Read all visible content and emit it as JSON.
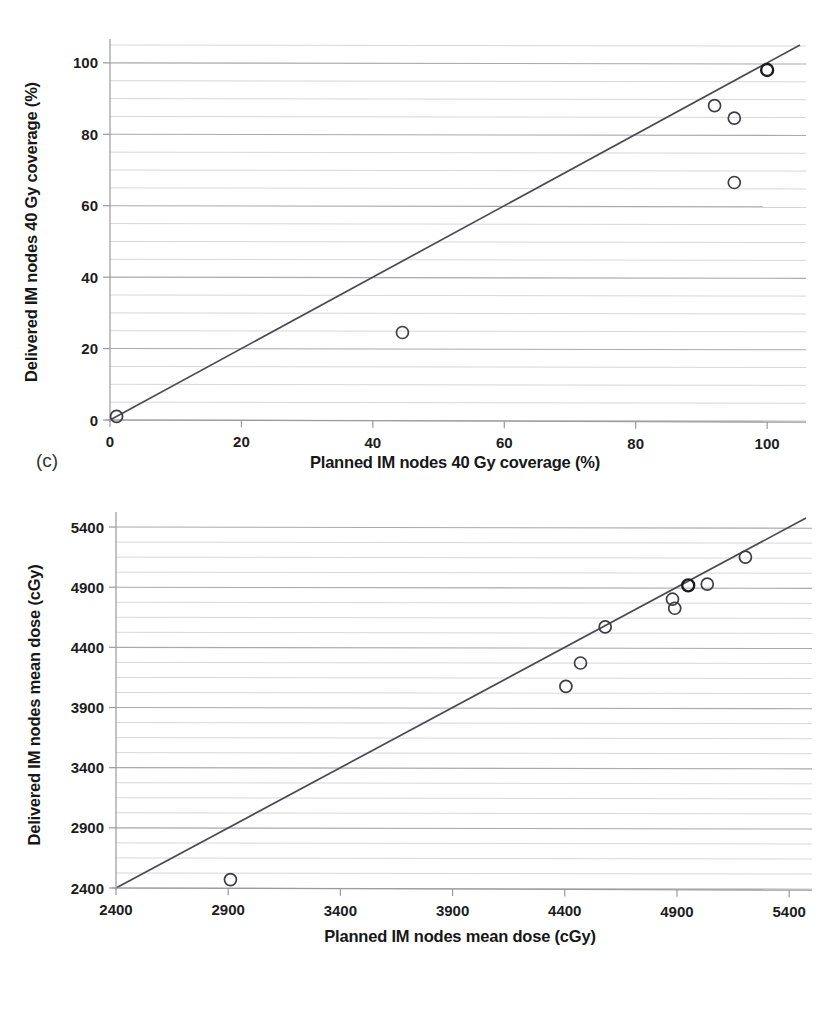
{
  "figure": {
    "panels": [
      {
        "letter": "(c)",
        "chart_index": 0
      },
      {
        "letter": "(d)",
        "chart_index": 1
      }
    ]
  },
  "chart_data": [
    {
      "type": "scatter",
      "title": "",
      "xlabel": "Planned IM nodes 40 Gy coverage (%)",
      "ylabel": "Delivered IM nodes 40 Gy coverage (%)",
      "xlim": [
        0,
        105
      ],
      "ylim": [
        0,
        105
      ],
      "xticks": [
        0,
        20,
        40,
        60,
        80,
        100
      ],
      "xtick_labels": [
        "0",
        "20",
        "40",
        "60",
        "80",
        "100"
      ],
      "yticks": [
        0,
        20,
        40,
        60,
        80,
        100
      ],
      "ytick_labels": [
        "0",
        "20",
        "40",
        "60",
        "80",
        "100"
      ],
      "grid": true,
      "grid_minor_step": 5,
      "legend": "none",
      "annotations": [
        "(c)"
      ],
      "reference_line": {
        "name": "identity-line",
        "description": "y = x line of identity",
        "from": [
          0,
          0
        ],
        "to": [
          105,
          105
        ]
      },
      "points": [
        {
          "x": 1.0,
          "y": 1.0,
          "emphasis": "normal"
        },
        {
          "x": 44.5,
          "y": 24.5,
          "emphasis": "normal"
        },
        {
          "x": 92.0,
          "y": 88.0,
          "emphasis": "normal"
        },
        {
          "x": 95.0,
          "y": 84.5,
          "emphasis": "normal"
        },
        {
          "x": 95.0,
          "y": 66.5,
          "emphasis": "normal"
        },
        {
          "x": 100.0,
          "y": 98.0,
          "emphasis": "dark"
        }
      ]
    },
    {
      "type": "scatter",
      "title": "",
      "xlabel": "Planned IM nodes mean dose (cGy)",
      "ylabel": "Delivered IM nodes mean dose (cGy)",
      "xlim": [
        2400,
        5475
      ],
      "ylim": [
        2400,
        5475
      ],
      "xticks": [
        2400,
        2900,
        3400,
        3900,
        4400,
        4900,
        5400
      ],
      "xtick_labels": [
        "2400",
        "2900",
        "3400",
        "3900",
        "4400",
        "4900",
        "5400"
      ],
      "yticks": [
        2400,
        2900,
        3400,
        3900,
        4400,
        4900,
        5400
      ],
      "ytick_labels": [
        "2400",
        "2900",
        "3400",
        "3900",
        "4400",
        "4900",
        "5400"
      ],
      "grid": true,
      "grid_minor_step": 125,
      "legend": "none",
      "annotations": [
        "(d)"
      ],
      "reference_line": {
        "name": "identity-line",
        "description": "y = x line of identity",
        "from": [
          2400,
          2400
        ],
        "to": [
          5475,
          5475
        ]
      },
      "points": [
        {
          "x": 2910,
          "y": 2470,
          "emphasis": "normal"
        },
        {
          "x": 4405,
          "y": 4075,
          "emphasis": "normal"
        },
        {
          "x": 4470,
          "y": 4270,
          "emphasis": "normal"
        },
        {
          "x": 4580,
          "y": 4570,
          "emphasis": "normal"
        },
        {
          "x": 4880,
          "y": 4800,
          "emphasis": "normal"
        },
        {
          "x": 4890,
          "y": 4725,
          "emphasis": "normal"
        },
        {
          "x": 4950,
          "y": 4915,
          "emphasis": "dark"
        },
        {
          "x": 5035,
          "y": 4925,
          "emphasis": "normal"
        },
        {
          "x": 5205,
          "y": 5150,
          "emphasis": "normal"
        }
      ]
    }
  ],
  "colors": {
    "grid_minor": "#d8d8dc",
    "grid_major": "#a9a9ae",
    "axis": "#9a9a9f",
    "identity_line": "#4a4a52",
    "marker": "#3d3d45",
    "marker_dark": "#1a1a1f",
    "text": "#1b1b1b",
    "background": "#ffffff"
  }
}
